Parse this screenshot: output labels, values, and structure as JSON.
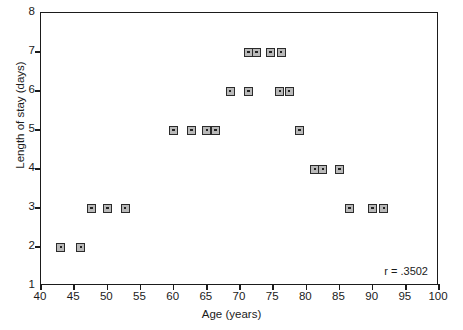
{
  "chart_data": {
    "type": "scatter",
    "title": "",
    "xlabel": "Age (years)",
    "ylabel": "Length of stay (days)",
    "xlim": [
      40,
      100
    ],
    "ylim": [
      1,
      8
    ],
    "xticks": [
      40,
      45,
      50,
      55,
      60,
      65,
      70,
      75,
      80,
      85,
      90,
      95,
      100
    ],
    "xticklabels": [
      "40",
      "45",
      "50",
      "55",
      "60",
      "65",
      "70",
      "75",
      "80",
      "85",
      "90",
      "95",
      "100"
    ],
    "yticks": [
      1,
      2,
      3,
      4,
      5,
      6,
      7,
      8
    ],
    "yticklabels": [
      "1",
      "2",
      "3",
      "4",
      "5",
      "6",
      "7",
      "8"
    ],
    "grid": false,
    "legend": false,
    "marker_style": "square-with-center-dot",
    "marker_fill": "#b9b9b9",
    "marker_edge": "#2b2b2b",
    "frame_color": "#1b1b1b",
    "annotations": [
      {
        "name": "correlation",
        "text": "r = .3502",
        "position": "bottom-right"
      }
    ],
    "points": [
      {
        "x": 43.0,
        "y": 2
      },
      {
        "x": 46.0,
        "y": 2
      },
      {
        "x": 47.6,
        "y": 3
      },
      {
        "x": 50.0,
        "y": 3
      },
      {
        "x": 52.7,
        "y": 3
      },
      {
        "x": 60.0,
        "y": 5
      },
      {
        "x": 62.7,
        "y": 5
      },
      {
        "x": 65.0,
        "y": 5
      },
      {
        "x": 66.3,
        "y": 5
      },
      {
        "x": 68.5,
        "y": 6
      },
      {
        "x": 71.3,
        "y": 6
      },
      {
        "x": 71.3,
        "y": 7
      },
      {
        "x": 72.5,
        "y": 7
      },
      {
        "x": 74.6,
        "y": 7
      },
      {
        "x": 76.2,
        "y": 7
      },
      {
        "x": 76.0,
        "y": 6
      },
      {
        "x": 77.4,
        "y": 6
      },
      {
        "x": 79.0,
        "y": 5
      },
      {
        "x": 81.3,
        "y": 4
      },
      {
        "x": 82.5,
        "y": 4
      },
      {
        "x": 85.0,
        "y": 4
      },
      {
        "x": 86.5,
        "y": 3
      },
      {
        "x": 90.0,
        "y": 3
      },
      {
        "x": 91.7,
        "y": 3
      }
    ]
  }
}
